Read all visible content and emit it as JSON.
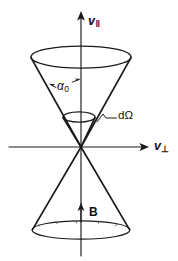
{
  "figure": {
    "kind": "loss-cone-velocity-space-diagram",
    "background_color": "#ffffff",
    "ink_color": "#1a1a1a",
    "width": 178,
    "height": 261,
    "labels": {
      "v_parallel": {
        "base": "v",
        "subscript": "‖",
        "full": "v‖",
        "meaning": "parallel velocity axis (vertical)"
      },
      "v_perpendicular": {
        "base": "v",
        "subscript": "⊥",
        "full": "v⊥",
        "meaning": "perpendicular velocity axis (horizontal)"
      },
      "pitch_angle": {
        "base": "α",
        "subscript": "0",
        "full": "α₀",
        "meaning": "loss cone pitch angle"
      },
      "solid_angle": {
        "full": "dΩ",
        "meaning": "differential solid angle element"
      },
      "magnetic_field": {
        "full": "B",
        "meaning": "magnetic field vector along axis"
      }
    }
  },
  "geometry": {
    "origin": {
      "x": 81,
      "y": 147
    },
    "vertical_axis": {
      "x": 81,
      "top_y": 12,
      "bottom_y": 256
    },
    "horizontal_axis": {
      "y": 147,
      "left_x": 9,
      "right_x": 149
    },
    "upper_cone": {
      "rim_center": {
        "x": 81,
        "y": 57
      },
      "rim_rx": 50,
      "rim_ry": 11,
      "apex": {
        "x": 81,
        "y": 147
      }
    },
    "inner_cone": {
      "rim_center": {
        "x": 79,
        "y": 117
      },
      "rim_rx": 16,
      "rim_ry": 5,
      "apex": {
        "x": 81,
        "y": 147
      }
    },
    "lower_cone": {
      "rim_center": {
        "x": 81,
        "y": 230
      },
      "rim_rx": 49,
      "rim_ry": 9,
      "apex": {
        "x": 81,
        "y": 147
      }
    },
    "b_arrow": {
      "x": 81,
      "tail_y": 222,
      "tip_y": 203
    }
  }
}
